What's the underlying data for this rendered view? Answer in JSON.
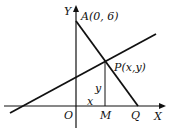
{
  "diagram": {
    "axis_y_label": "Y",
    "axis_x_label": "X",
    "origin_label": "O",
    "point_a_label": "A(0, 6)",
    "point_p_label": "P(x,y)",
    "point_m_label": "M",
    "point_q_label": "Q",
    "segment_x_label": "x",
    "segment_y_label": "y",
    "line_color": "#111111"
  }
}
